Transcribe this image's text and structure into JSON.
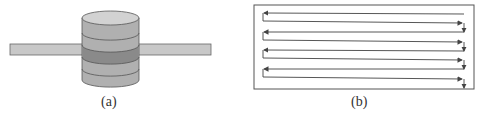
{
  "figure": {
    "panel_a": {
      "caption": "(a)",
      "description": "Stacked cylinder with horizontal bar passing through",
      "colors": {
        "bar": "#c8c8c8",
        "top": "#d2d2d2",
        "layer_light": "#b0b0b0",
        "layer_dark": "#8a8a8a",
        "outline": "#555555"
      }
    },
    "panel_b": {
      "caption": "(b)",
      "description": "Raster / serpentine scan path with arrows inside a rectangle",
      "rows": 4,
      "colors": {
        "line": "#444444",
        "frame": "#555555"
      }
    }
  }
}
